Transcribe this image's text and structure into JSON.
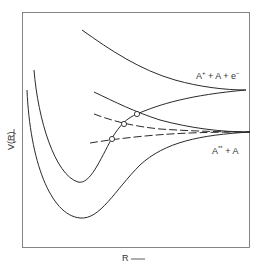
{
  "diagram": {
    "axes": {
      "x_label": "R",
      "x_arrow": "→",
      "y_label": "V(R)",
      "y_arrow": "→"
    },
    "asymptote_labels": {
      "upper": {
        "base": "A",
        "sup": "+",
        "rest": " + A + e",
        "rest_sup": "−"
      },
      "lower": {
        "base": "A",
        "sup": "**",
        "rest": " + A"
      }
    },
    "curves": [
      {
        "name": "ion-molecule-bound",
        "style": "solid",
        "description": "deep well curve rising to A+ + A + e- asymptote"
      },
      {
        "name": "ground-bound-state",
        "style": "solid",
        "description": "deepest well rising to A** + A asymptote"
      },
      {
        "name": "repulsive-upper",
        "style": "solid",
        "description": "repulsive curve descending to A+ + A + e- asymptote"
      },
      {
        "name": "repulsive-middle",
        "style": "solid",
        "description": "repulsive curve descending to A** + A asymptote"
      },
      {
        "name": "diabatic-dashed-1",
        "style": "dashed"
      },
      {
        "name": "diabatic-dashed-2",
        "style": "dashed"
      }
    ],
    "crossing_points": 3
  },
  "colors": {
    "line": "#2a2a2a",
    "frame": "#555555",
    "background": "#ffffff"
  }
}
